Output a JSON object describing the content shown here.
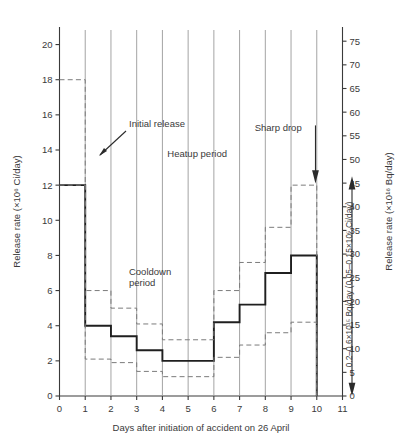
{
  "chart_data": {
    "type": "line",
    "title": "",
    "xlabel": "Days after initiation of accident on 26 April",
    "ylabel": "Release rate (×10⁶ Ci/day)",
    "y2label": "Release rate (×10¹⁶ Bq/day)",
    "xlim": [
      0,
      11
    ],
    "ylim": [
      0,
      21
    ],
    "y2lim": [
      0,
      78
    ],
    "grid": false,
    "legend_position": "none",
    "xticks": [
      0,
      1,
      2,
      3,
      4,
      5,
      6,
      7,
      8,
      9,
      10,
      11
    ],
    "xticklabels": [
      "0",
      "1",
      "2",
      "3",
      "4",
      "5",
      "6",
      "7",
      "8",
      "9",
      "10",
      "11"
    ],
    "yticks": [
      0,
      2,
      4,
      6,
      8,
      10,
      12,
      14,
      16,
      18,
      20
    ],
    "yticklabels": [
      "0",
      "2",
      "4",
      "6",
      "8",
      "10",
      "12",
      "14",
      "16",
      "18",
      "20"
    ],
    "y2ticks": [
      0,
      5,
      10,
      15,
      20,
      25,
      30,
      35,
      40,
      45,
      50,
      55,
      60,
      65,
      70,
      75
    ],
    "y2ticklabels": [
      "0",
      "5",
      "10",
      "15",
      "20",
      "25",
      "30",
      "35",
      "40",
      "45",
      "50",
      "55",
      "60",
      "65",
      "70",
      "75"
    ],
    "categories": [
      "1",
      "2",
      "3",
      "4",
      "5",
      "6",
      "7",
      "8",
      "9",
      "10",
      "11"
    ],
    "series": [
      {
        "name": "Best estimate release rate",
        "style": "solid-step",
        "values": [
          12.0,
          4.0,
          3.4,
          2.6,
          2.0,
          2.0,
          4.2,
          5.2,
          7.0,
          8.0,
          0.0
        ]
      },
      {
        "name": "Upper bound estimate",
        "style": "dashed-step",
        "values": [
          18.0,
          6.0,
          5.0,
          4.1,
          3.2,
          3.2,
          6.0,
          7.6,
          9.6,
          12.0,
          0.0
        ]
      },
      {
        "name": "Lower bound estimate",
        "style": "dashed-step",
        "values": [
          12.0,
          2.1,
          1.9,
          1.4,
          1.1,
          1.1,
          2.2,
          2.9,
          3.6,
          4.2,
          0.0
        ]
      }
    ],
    "annotations": [
      {
        "id": "initial-release",
        "text": "Initial release",
        "points_to_day": 1,
        "points_to_value": 14.0
      },
      {
        "id": "heatup-period",
        "text": "Heatup period",
        "at_day": 6.0,
        "at_value": 13.4
      },
      {
        "id": "cooldown-period",
        "text": "Cooldown\nperiod",
        "line1": "Cooldown",
        "line2": "period",
        "at_day": 3.5,
        "at_value": 6.6
      },
      {
        "id": "sharp-drop",
        "text": "Sharp drop",
        "points_to_day": 10.6,
        "points_to_value": 13.0
      },
      {
        "id": "residual-release",
        "text": "0.2–0.6×10¹⁵ Bq/day (0.05–0.15×10⁶ Ci/day)"
      }
    ]
  },
  "axes": {
    "left_title": "Release rate (×10⁶ Ci/day)",
    "right_title": "Release rate (×10¹⁶ Bq/day)",
    "bottom_title": "Days after initiation of accident on 26 April"
  }
}
